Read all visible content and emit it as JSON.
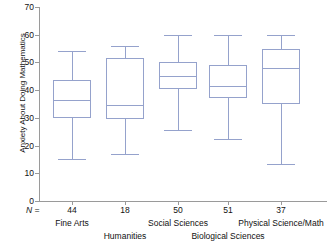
{
  "chart_data": {
    "type": "box",
    "title": "",
    "xlabel": "",
    "ylabel": "Anxiety About Doing Mathematics",
    "ylim": [
      0,
      70
    ],
    "yticks": [
      0,
      10,
      20,
      30,
      40,
      50,
      60,
      70
    ],
    "grid": false,
    "legend": null,
    "n_prefix": "N =",
    "accent_color": "#95a2cc",
    "axis_color": "#9a9a9a",
    "categories": [
      "Fine Arts",
      "Humanities",
      "Social Sciences",
      "Biological Sciences",
      "Physical Science/Math"
    ],
    "counts": [
      44,
      18,
      50,
      51,
      37
    ],
    "boxes": [
      {
        "category": "Fine Arts",
        "n": 44,
        "whisker_low": 15.0,
        "q1": 30.0,
        "median": 36.5,
        "q3": 43.5,
        "whisker_high": 54.0
      },
      {
        "category": "Humanities",
        "n": 18,
        "whisker_low": 17.0,
        "q1": 29.5,
        "median": 34.5,
        "q3": 51.5,
        "whisker_high": 56.0
      },
      {
        "category": "Social Sciences",
        "n": 50,
        "whisker_low": 25.5,
        "q1": 40.5,
        "median": 45.0,
        "q3": 50.0,
        "whisker_high": 60.0
      },
      {
        "category": "Biological Sciences",
        "n": 51,
        "whisker_low": 22.5,
        "q1": 37.0,
        "median": 41.5,
        "q3": 49.0,
        "whisker_high": 60.0
      },
      {
        "category": "Physical Science/Math",
        "n": 37,
        "whisker_low": 13.5,
        "q1": 35.0,
        "median": 48.0,
        "q3": 55.0,
        "whisker_high": 60.0
      }
    ]
  },
  "axis": {
    "tick_labels": [
      "70",
      "60",
      "50",
      "40",
      "30",
      "20",
      "10",
      "0"
    ]
  }
}
